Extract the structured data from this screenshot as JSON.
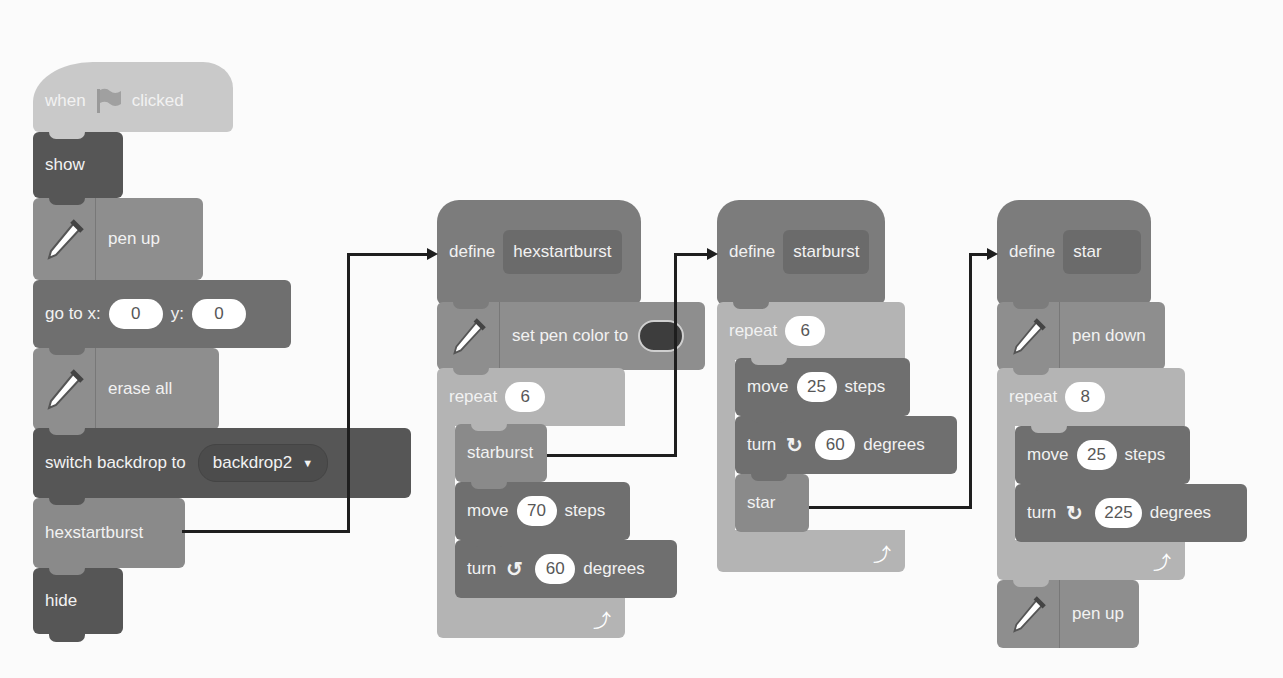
{
  "scripts": {
    "main": {
      "hat": {
        "when": "when",
        "clicked": "clicked",
        "icon": "green-flag-icon"
      },
      "show": "show",
      "pen_up": "pen up",
      "goto": {
        "label": "go to x:",
        "x": "0",
        "y_label": "y:",
        "y": "0"
      },
      "erase_all": "erase all",
      "switch_backdrop": {
        "label": "switch backdrop to",
        "value": "backdrop2"
      },
      "call": "hexstartburst",
      "hide": "hide"
    },
    "hexstartburst": {
      "define": "define",
      "name": "hexstartburst",
      "set_pen_color": "set pen color to",
      "pen_color": "#3d3d3d",
      "repeat": {
        "label": "repeat",
        "count": "6"
      },
      "call": "starburst",
      "move": {
        "label": "move",
        "value": "70",
        "unit": "steps"
      },
      "turn": {
        "label": "turn",
        "direction": "counter-clockwise",
        "value": "60",
        "unit": "degrees"
      }
    },
    "starburst": {
      "define": "define",
      "name": "starburst",
      "repeat": {
        "label": "repeat",
        "count": "6"
      },
      "move": {
        "label": "move",
        "value": "25",
        "unit": "steps"
      },
      "turn": {
        "label": "turn",
        "direction": "clockwise",
        "value": "60",
        "unit": "degrees"
      },
      "call": "star"
    },
    "star": {
      "define": "define",
      "name": "star",
      "pen_down": "pen down",
      "repeat": {
        "label": "repeat",
        "count": "8"
      },
      "move": {
        "label": "move",
        "value": "25",
        "unit": "steps"
      },
      "turn": {
        "label": "turn",
        "direction": "clockwise",
        "value": "225",
        "unit": "degrees"
      },
      "pen_up": "pen up"
    }
  },
  "icons": {
    "rotate_ccw": "↺",
    "rotate_cw": "↻",
    "loop": "⤴",
    "caret": "▼"
  }
}
